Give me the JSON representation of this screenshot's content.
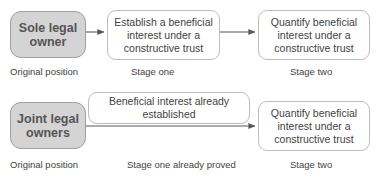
{
  "diagram": {
    "colors": {
      "node_gray_fill": "#d4d4d4",
      "node_gray_border": "#9e9e9e",
      "node_gray_text": "#555555",
      "node_white_fill": "#ffffff",
      "node_white_border": "#bdbdbd",
      "node_white_text": "#3f3f3f",
      "arrow": "#595959",
      "caption_text": "#3f3f3f",
      "background": "#ffffff"
    },
    "rows": [
      {
        "name": "sole-legal-owner-row",
        "start_node": "Sole legal owner",
        "stage_one_node": "Establish a beneficial interest under a constructive trust",
        "stage_two_node": "Quantify beneficial interest under a constructive trust",
        "captions": [
          "Original position",
          "Stage one",
          "Stage two"
        ]
      },
      {
        "name": "joint-legal-owners-row",
        "start_node": "Joint legal owners",
        "stage_one_node": "Beneficial interest already established",
        "stage_two_node": "Quantify beneficial interest under a constructive trust",
        "captions": [
          "Original position",
          "Stage one already proved",
          "Stage two"
        ]
      }
    ],
    "nodes": {
      "sole_legal_owner": "Sole legal owner",
      "establish_interest": "Establish a beneficial interest under a constructive trust",
      "quantify_interest_top": "Quantify beneficial interest under a constructive trust",
      "joint_legal_owners": "Joint legal owners",
      "beneficial_established": "Beneficial interest already established",
      "quantify_interest_bottom": "Quantify beneficial interest under a constructive trust"
    },
    "captions": {
      "original_position_top": "Original position",
      "stage_one": "Stage one",
      "stage_two_top": "Stage two",
      "original_position_bottom": "Original position",
      "stage_one_already_proved": "Stage one already proved",
      "stage_two_bottom": "Stage two"
    },
    "arrows": [
      {
        "name": "arrow-sole-to-establish",
        "from": "sole_legal_owner",
        "to": "establish_interest"
      },
      {
        "name": "arrow-establish-to-quantify",
        "from": "establish_interest",
        "to": "quantify_interest_top"
      },
      {
        "name": "arrow-joint-to-quantify",
        "from": "joint_legal_owners",
        "to": "quantify_interest_bottom"
      }
    ]
  }
}
